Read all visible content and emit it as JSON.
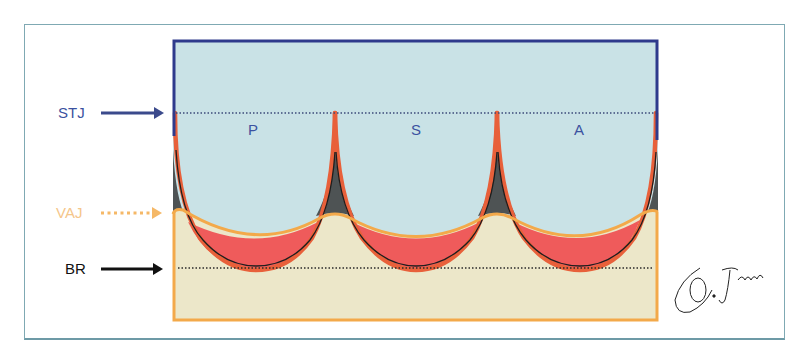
{
  "labels": {
    "stj": "STJ",
    "vaj": "VAJ",
    "br": "BR"
  },
  "cusps": {
    "left": "P",
    "middle": "S",
    "right": "A"
  },
  "signature": "O. Jgarcia",
  "colors": {
    "aorta_fill": "#c9e2e6",
    "aorta_border": "#2e3a8c",
    "stj_label": "#3b52a0",
    "vaj_label": "#f5c68a",
    "vaj_arrow": "#f5b867",
    "br_label": "#111111",
    "ventricle_fill": "#ece7c9",
    "ventricle_border": "#f3a94a",
    "leaflet_orange": "#e8603a",
    "leaflet_red": "#ef5b5b",
    "triangle_dark": "#4e5354",
    "frame_border": "#7fa9b3"
  },
  "icons": {
    "stj_arrow": "arrow-right-icon",
    "vaj_arrow": "dotted-arrow-right-icon",
    "br_arrow": "arrow-right-icon"
  }
}
